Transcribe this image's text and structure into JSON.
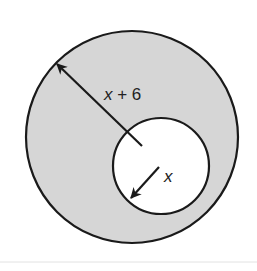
{
  "diagram": {
    "type": "concentric-annulus",
    "outer_circle": {
      "cx": 132,
      "cy": 137,
      "r": 106,
      "fill": "#d6d6d6",
      "stroke": "#1a1a1a"
    },
    "inner_circle": {
      "cx": 161,
      "cy": 166,
      "r": 48,
      "fill": "#ffffff",
      "stroke": "#1a1a1a"
    },
    "labels": {
      "outer_radius": {
        "var": "x",
        "rest": " + 6"
      },
      "inner_radius": {
        "var": "x"
      }
    },
    "colors": {
      "shaded_region": "#d6d6d6",
      "stroke": "#1a1a1a",
      "background": "#ffffff",
      "rule": "#e2e2e2"
    }
  }
}
